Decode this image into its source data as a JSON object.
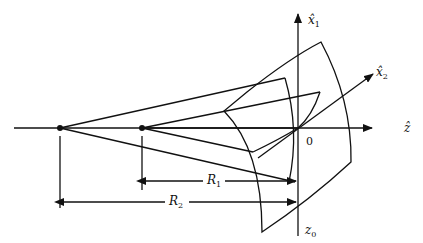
{
  "figure": {
    "axes": {
      "z_hat": "ẑ",
      "x1_hat_base": "x̂",
      "x1_sub": "1",
      "x2_hat_base": "x̂",
      "x2_sub": "2"
    },
    "labels": {
      "origin": "0",
      "z0_base": "z",
      "z0_sub": "0",
      "R1_base": "R",
      "R1_sub": "1",
      "R2_base": "R",
      "R2_sub": "2"
    },
    "points": [
      {
        "name": "center-of-curvature-2",
        "x": 60,
        "y": 128
      },
      {
        "name": "center-of-curvature-1",
        "x": 142,
        "y": 128
      }
    ],
    "colors": {
      "stroke": "#111111",
      "background": "#ffffff"
    }
  }
}
